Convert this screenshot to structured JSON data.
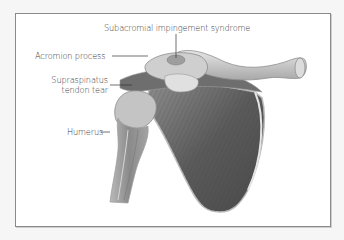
{
  "figure": {
    "labels": {
      "subacromial": "Subacromial impingement syndrome",
      "acromion": "Acromion process",
      "supraspinatus_line1": "Supraspinatus",
      "supraspinatus_line2": "tendon tear",
      "humerus": "Humerus"
    },
    "colors": {
      "background": "#f6f6f6",
      "panel": "#ffffff",
      "border": "#8a8a8a",
      "label_text": "#3a3a3a",
      "leader_line": "#333333",
      "bone_light": "#d8d8d8",
      "muscle_dark": "#555555"
    }
  }
}
